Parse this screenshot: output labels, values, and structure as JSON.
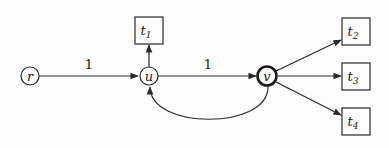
{
  "nodes": {
    "r": {
      "label": "r",
      "shape": "circle"
    },
    "u": {
      "label": "u",
      "shape": "circle"
    },
    "v": {
      "label": "v",
      "shape": "circle-bold"
    },
    "t1": {
      "label": "t",
      "sub": "1",
      "shape": "box"
    },
    "t2": {
      "label": "t",
      "sub": "2",
      "shape": "box"
    },
    "t3": {
      "label": "t",
      "sub": "3",
      "shape": "box"
    },
    "t4": {
      "label": "t",
      "sub": "4",
      "shape": "box"
    }
  },
  "edges": [
    {
      "from": "r",
      "to": "u",
      "label": "1"
    },
    {
      "from": "u",
      "to": "v",
      "label": "1"
    },
    {
      "from": "u",
      "to": "t1",
      "label": ""
    },
    {
      "from": "v",
      "to": "t2",
      "label": ""
    },
    {
      "from": "v",
      "to": "t3",
      "label": ""
    },
    {
      "from": "v",
      "to": "t4",
      "label": ""
    },
    {
      "from": "v",
      "to": "u",
      "label": "",
      "style": "curved-below"
    }
  ],
  "edge_labels": {
    "r_u": "1",
    "u_v": "1"
  },
  "colors": {
    "stroke": "#2a2a2a",
    "background": "#fdfdfd"
  }
}
